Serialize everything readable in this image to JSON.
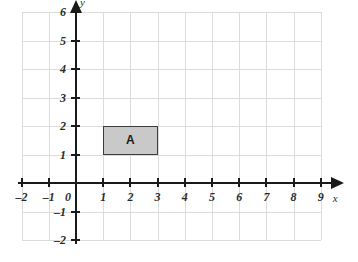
{
  "chart_data": {
    "type": "scatter",
    "title": "",
    "xlabel": "x",
    "ylabel": "y",
    "xlim": [
      -2,
      9
    ],
    "ylim": [
      -2,
      6
    ],
    "grid": true,
    "x_ticks": [
      -2,
      -1,
      0,
      1,
      2,
      3,
      4,
      5,
      6,
      7,
      8,
      9
    ],
    "y_ticks": [
      -2,
      -1,
      1,
      2,
      3,
      4,
      5,
      6
    ],
    "x_tick_labels": [
      "–2",
      "–1",
      "0",
      "1",
      "2",
      "3",
      "4",
      "5",
      "6",
      "7",
      "8",
      "9"
    ],
    "y_tick_labels": [
      "–2",
      "–1",
      "1",
      "2",
      "3",
      "4",
      "5",
      "6"
    ],
    "origin_label": "0",
    "shapes": [
      {
        "name": "A",
        "label": "A",
        "type": "rectangle",
        "x_min": 1,
        "x_max": 3,
        "y_min": 1,
        "y_max": 2,
        "vertices": [
          [
            1,
            1
          ],
          [
            3,
            1
          ],
          [
            3,
            2
          ],
          [
            1,
            2
          ]
        ],
        "label_x": 2,
        "label_y": 1.5,
        "fill": "#c9c9c9",
        "stroke": "#3c3c3c"
      }
    ],
    "colors": {
      "grid": "#dcdcdc",
      "axis": "#1a1a1a",
      "background": "#ffffff",
      "tick_text": "#2b2b2b"
    }
  }
}
